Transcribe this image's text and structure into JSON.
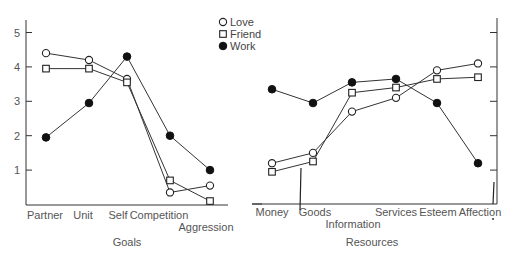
{
  "chart_data": [
    {
      "type": "line",
      "title": "",
      "xlabel": "Goals",
      "ylabel": "",
      "ylim": [
        0,
        5.3
      ],
      "yticks": [
        1,
        2,
        3,
        4,
        5
      ],
      "grid": false,
      "legend_position": "top-right",
      "categories": [
        "Partner",
        "Unit",
        "Self",
        "Competition",
        "Aggression"
      ],
      "series": [
        {
          "name": "Love",
          "marker": "open-circle",
          "values": [
            4.4,
            4.2,
            3.65,
            0.35,
            0.55
          ]
        },
        {
          "name": "Friend",
          "marker": "open-square",
          "values": [
            3.95,
            3.95,
            3.55,
            0.7,
            0.1
          ]
        },
        {
          "name": "Work",
          "marker": "filled-circle",
          "values": [
            1.95,
            2.95,
            4.3,
            2.0,
            1.0
          ]
        }
      ]
    },
    {
      "type": "line",
      "title": "",
      "xlabel": "Resources",
      "ylabel": "",
      "ylim": [
        0,
        5.3
      ],
      "yticks": [
        1,
        2,
        3,
        4,
        5
      ],
      "grid": false,
      "categories": [
        "Money",
        "Goods",
        "Information",
        "Services",
        "Esteem",
        "Affection"
      ],
      "series": [
        {
          "name": "Love",
          "marker": "open-circle",
          "values": [
            1.2,
            1.5,
            2.7,
            3.1,
            3.9,
            4.1
          ]
        },
        {
          "name": "Friend",
          "marker": "open-square",
          "values": [
            0.95,
            1.25,
            3.25,
            3.4,
            3.65,
            3.7
          ]
        },
        {
          "name": "Work",
          "marker": "filled-circle",
          "values": [
            3.35,
            2.95,
            3.55,
            3.65,
            2.95,
            1.2
          ]
        }
      ]
    }
  ],
  "legend": {
    "items": [
      {
        "label": "Love",
        "marker": "open-circle"
      },
      {
        "label": "Friend",
        "marker": "open-square"
      },
      {
        "label": "Work",
        "marker": "filled-circle"
      }
    ]
  },
  "left_panel": {
    "axis_title": "Goals",
    "y_tick_labels": [
      "5",
      "4",
      "3",
      "2",
      "1"
    ]
  },
  "right_panel": {
    "axis_title": "Resources"
  },
  "colors": {
    "line": "#333333",
    "marker_fill": "#111111",
    "text": "#555555"
  }
}
